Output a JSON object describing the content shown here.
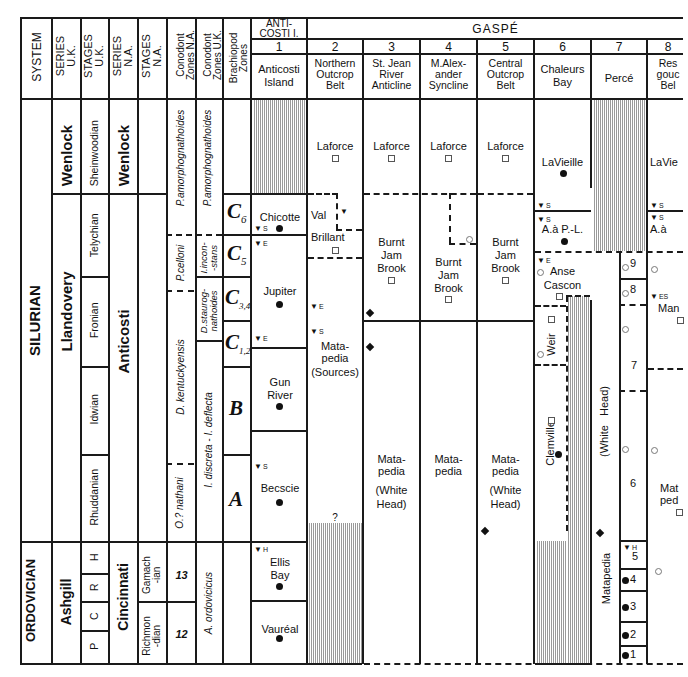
{
  "header": {
    "system": "SYSTEM",
    "series_uk": [
      "SERIES",
      "U.K."
    ],
    "stages_uk": [
      "STAGES",
      "U.K."
    ],
    "series_na": [
      "SERIES",
      "N.A."
    ],
    "stages_na": [
      "STAGES",
      "N.A."
    ],
    "conodont_na": [
      "Conodont",
      "Zones N.A."
    ],
    "conodont_uk": [
      "Conodont",
      "Zones U.K."
    ],
    "brachiopod": [
      "Brachiopod",
      "Zones"
    ],
    "anticosti_group": [
      "ANTI-",
      "COSTI I."
    ],
    "gaspe_group": "GASPÉ"
  },
  "localities": [
    {
      "num": "1",
      "name": [
        "Anticosti",
        "Island"
      ]
    },
    {
      "num": "2",
      "name": [
        "Northern",
        "Outcrop",
        "Belt"
      ]
    },
    {
      "num": "3",
      "name": [
        "St. Jean",
        "River",
        "Anticline"
      ]
    },
    {
      "num": "4",
      "name": [
        "M.Alex-",
        "ander",
        "Syncline"
      ]
    },
    {
      "num": "5",
      "name": [
        "Central",
        "Outcrop",
        "Belt"
      ]
    },
    {
      "num": "6",
      "name": [
        "Chaleurs",
        "Bay"
      ]
    },
    {
      "num": "7",
      "name": [
        "Percé"
      ]
    },
    {
      "num": "8",
      "name": [
        "Res",
        "gouc",
        "Bel"
      ]
    }
  ],
  "systems": {
    "silurian": "SILURIAN",
    "ordovician": "ORDOVICIAN"
  },
  "series_uk": {
    "wenlock": "Wenlock",
    "llandovery": "Llandovery",
    "ashgill": "Ashgill"
  },
  "stages_uk": {
    "sheinwoodian": "Sheinwoodian",
    "telychian": "Telychian",
    "fronian": "Fronian",
    "idwian": "Idwian",
    "rhuddanian": "Rhuddanian",
    "h": "H",
    "r": "R",
    "c": "C",
    "p": "P"
  },
  "series_na": {
    "wenlock": "Wenlock",
    "anticosti": "Anticosti",
    "cincinnati": "Cincinnati"
  },
  "stages_na": {
    "gamachian": [
      "Gamach",
      "-ian"
    ],
    "richmondian": [
      "Richmon",
      "-dian"
    ]
  },
  "conodont_na": {
    "pamorph": "P.amorphognathoides",
    "pcelloni": "P.celloni",
    "dkent": "D. kentuckyensis",
    "onathani": "O.? nathani",
    "z13": "13",
    "z12": "12"
  },
  "conodont_uk": {
    "pamorph": "P.amorphognathoides",
    "iincon": [
      "I.incon-",
      "-stans"
    ],
    "dstaurog": [
      "D.staurog-",
      "nathoides"
    ],
    "idiscreta": "I. discreta - I. deflecta",
    "aordov": "A. ordovicicus"
  },
  "brachiopod_zones": {
    "c6": "C",
    "c6sub": "6",
    "c5": "C",
    "c5sub": "5",
    "c34": "C",
    "c34sub": "3,4",
    "c12": "C",
    "c12sub": "1,2",
    "b": "B",
    "a": "A"
  },
  "col1": {
    "chicotte": "Chicotte",
    "jupiter": "Jupiter",
    "gunriver": [
      "Gun",
      "River"
    ],
    "becscie": "Becscie",
    "ellisbay": [
      "Ellis",
      "Bay"
    ],
    "vaureal": "Vauréal"
  },
  "col2": {
    "laforce": "Laforce",
    "valbrillant": [
      "Val",
      "Brillant"
    ],
    "matapedia": [
      "Mata-",
      "pedia",
      "(Sources)"
    ],
    "question": "?"
  },
  "col3": {
    "laforce": "Laforce",
    "burnt": [
      "Burnt",
      "Jam",
      "Brook"
    ],
    "matapedia": [
      "Mata-",
      "pedia"
    ],
    "whitehead": [
      "(White",
      "Head)"
    ]
  },
  "col4": {
    "laforce": "Laforce",
    "burnt": [
      "Burnt",
      "Jam",
      "Brook"
    ],
    "matapedia": [
      "Mata-",
      "pedia"
    ]
  },
  "col5": {
    "laforce": "Laforce",
    "burnt": [
      "Burnt",
      "Jam",
      "Brook"
    ],
    "matapedia": [
      "Mata-",
      "pedia"
    ],
    "whitehead": [
      "(White",
      "Head)"
    ]
  },
  "col6": {
    "lavieille": "LaVieille",
    "aapl": "A.à P.-L.",
    "anse": [
      "Anse",
      "Cascon"
    ],
    "weir": "Weir",
    "clemville": "Clemville"
  },
  "col7": {
    "whitehead": "(White   Head)",
    "matapedia": "Matapedia",
    "units": [
      "9",
      "8",
      "7",
      "6",
      "5",
      "4",
      "3",
      "2",
      "1"
    ]
  },
  "col8": {
    "lavieille": "LaVie",
    "aap": "A.à",
    "man": "Man",
    "matapedia": [
      "Mat",
      "ped"
    ]
  },
  "markers": {
    "s": "S",
    "e": "E",
    "h": "H",
    "es": "ES",
    "tri": "▼"
  }
}
